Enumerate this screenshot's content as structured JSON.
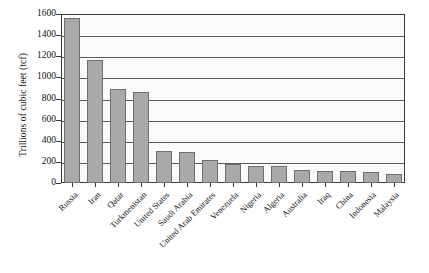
{
  "chart_data": {
    "type": "bar",
    "title": "",
    "xlabel": "",
    "ylabel": "Trillions of cubic feet (tcf)",
    "ylim": [
      0,
      1600
    ],
    "yticks": [
      0,
      200,
      400,
      600,
      800,
      1000,
      1200,
      1400,
      1600
    ],
    "ytick_labels": [
      "0",
      "200",
      "400",
      "600",
      "800",
      "1000",
      "1200",
      "1400",
      "1600"
    ],
    "grid": true,
    "legend": null,
    "bar_color": "#a9a9a9",
    "bar_edge_color": "#6f6f6f",
    "axis_color": "#3a3a3a",
    "categories": [
      "Russia",
      "Iran",
      "Qatar",
      "Turkmenistan",
      "United States",
      "Saudi Arabia",
      "United Arab Emirates",
      "Venezuela",
      "Nigeria",
      "Algeria",
      "Australia",
      "Iraq",
      "China",
      "Indonesia",
      "Malaysia"
    ],
    "values": [
      1560,
      1160,
      890,
      860,
      300,
      290,
      215,
      180,
      165,
      160,
      120,
      115,
      110,
      105,
      85
    ]
  }
}
